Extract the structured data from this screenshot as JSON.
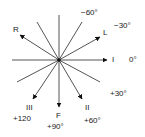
{
  "diagram": {
    "center": [
      59,
      60
    ],
    "line_color": "#555555",
    "arrow_color": "#111111",
    "axes": [
      {
        "name": "lead-I",
        "x1": 12,
        "y1": 60,
        "x2": 107,
        "y2": 60,
        "arrow": true
      },
      {
        "name": "lead-aVF",
        "x1": 59,
        "y1": 15,
        "x2": 59,
        "y2": 107,
        "arrow": true
      },
      {
        "name": "lead-aVR",
        "x1": 59,
        "y1": 60,
        "x2": 20,
        "y2": 35,
        "arrow": true
      },
      {
        "name": "lead-aVL",
        "x1": 59,
        "y1": 60,
        "x2": 100,
        "y2": 37,
        "arrow": true
      },
      {
        "name": "lead-III",
        "x1": 59,
        "y1": 60,
        "x2": 33,
        "y2": 99,
        "arrow": true
      },
      {
        "name": "lead-II",
        "x1": 59,
        "y1": 60,
        "x2": 82,
        "y2": 99,
        "arrow": true
      },
      {
        "name": "ref-minus60",
        "x1": 59,
        "y1": 60,
        "x2": 82,
        "y2": 22,
        "arrow": false
      },
      {
        "name": "ref-minus120",
        "x1": 59,
        "y1": 60,
        "x2": 37,
        "y2": 22,
        "arrow": false
      },
      {
        "name": "ref-plus150",
        "x1": 59,
        "y1": 60,
        "x2": 17,
        "y2": 82,
        "arrow": false
      },
      {
        "name": "ref-plus30",
        "x1": 59,
        "y1": 60,
        "x2": 100,
        "y2": 82,
        "arrow": false
      }
    ],
    "labels": {
      "R": "R",
      "L": "L",
      "I": "I",
      "F": "F",
      "II": "II",
      "III": "III",
      "minus60": "−60°",
      "minus30": "−30°",
      "zero": "0°",
      "plus30": "+30°",
      "plus60": "+60°",
      "plus90": "+90°",
      "plus120": "+120"
    }
  }
}
